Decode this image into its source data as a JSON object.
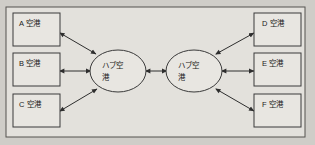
{
  "diagram": {
    "background_color": "#cfcdc8",
    "frame_color": "#e3e1dc",
    "node_fill": "#e8e6e1",
    "line_color": "#2e2e2e",
    "spoke_nodes_left": [
      {
        "id": "A",
        "label": "A 空港"
      },
      {
        "id": "B",
        "label": "B 空港"
      },
      {
        "id": "C",
        "label": "C 空港"
      }
    ],
    "spoke_nodes_right": [
      {
        "id": "D",
        "label": "D 空港"
      },
      {
        "id": "E",
        "label": "E 空港"
      },
      {
        "id": "F",
        "label": "F 空港"
      }
    ],
    "hubs": [
      {
        "id": "hub-left",
        "label_line1": "ハブ空",
        "label_line2": "港"
      },
      {
        "id": "hub-right",
        "label_line1": "ハブ空",
        "label_line2": "港"
      }
    ],
    "connections": [
      {
        "from": "A",
        "to": "hub-left",
        "arrow": "double"
      },
      {
        "from": "B",
        "to": "hub-left",
        "arrow": "double"
      },
      {
        "from": "C",
        "to": "hub-left",
        "arrow": "double"
      },
      {
        "from": "hub-left",
        "to": "hub-right",
        "arrow": "double"
      },
      {
        "from": "hub-right",
        "to": "D",
        "arrow": "double"
      },
      {
        "from": "hub-right",
        "to": "E",
        "arrow": "double"
      },
      {
        "from": "hub-right",
        "to": "F",
        "arrow": "double"
      }
    ]
  }
}
